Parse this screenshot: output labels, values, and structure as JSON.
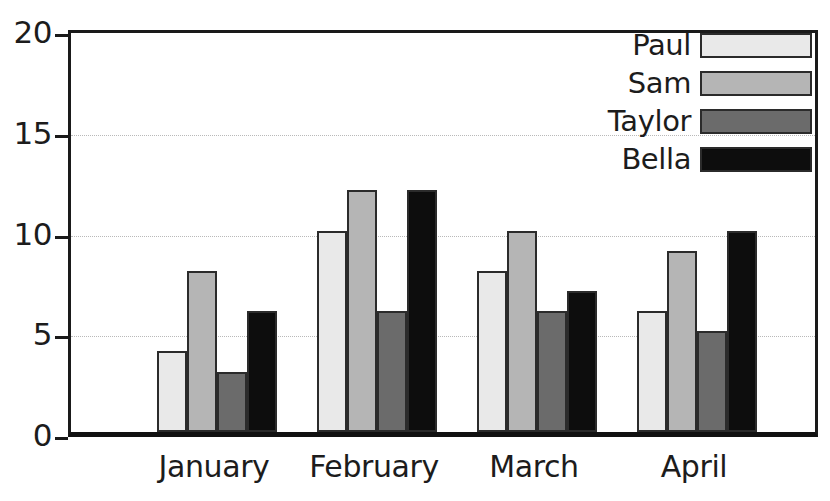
{
  "chart_data": {
    "type": "bar",
    "title": "",
    "xlabel": "",
    "ylabel": "",
    "categories": [
      "January",
      "February",
      "March",
      "April"
    ],
    "series": [
      {
        "name": "Paul",
        "color": "#e9e9e9",
        "values": [
          4,
          10,
          8,
          6
        ]
      },
      {
        "name": "Sam",
        "color": "#b5b5b5",
        "values": [
          8,
          12,
          10,
          9
        ]
      },
      {
        "name": "Taylor",
        "color": "#6b6b6b",
        "values": [
          3,
          6,
          6,
          5
        ]
      },
      {
        "name": "Bella",
        "color": "#0d0d0d",
        "values": [
          6,
          12,
          7,
          10
        ]
      }
    ],
    "ylim": [
      0,
      20
    ],
    "yticks": [
      0,
      5,
      10,
      15,
      20
    ],
    "ytick_labels": [
      "0",
      "5",
      "10",
      "15",
      "20"
    ],
    "grid": true,
    "grid_axis": "y",
    "legend_position": "top-right"
  },
  "axes": {
    "y_ticks": [
      {
        "value": 20,
        "label": "20"
      },
      {
        "value": 15,
        "label": "15"
      },
      {
        "value": 10,
        "label": "10"
      },
      {
        "value": 5,
        "label": "5"
      },
      {
        "value": 0,
        "label": "0"
      }
    ],
    "x_categories": [
      {
        "label": "January"
      },
      {
        "label": "February"
      },
      {
        "label": "March"
      },
      {
        "label": "April"
      }
    ]
  },
  "legend": {
    "entries": [
      {
        "label": "Paul",
        "color": "#e9e9e9"
      },
      {
        "label": "Sam",
        "color": "#b5b5b5"
      },
      {
        "label": "Taylor",
        "color": "#6b6b6b"
      },
      {
        "label": "Bella",
        "color": "#0d0d0d"
      }
    ]
  },
  "style": {
    "axis_color": "#1a1a1a",
    "grid_color": "#b9b9b9",
    "text_color": "#1c1c1c",
    "background": "#ffffff",
    "bar_outline": "#2b2b2b"
  }
}
